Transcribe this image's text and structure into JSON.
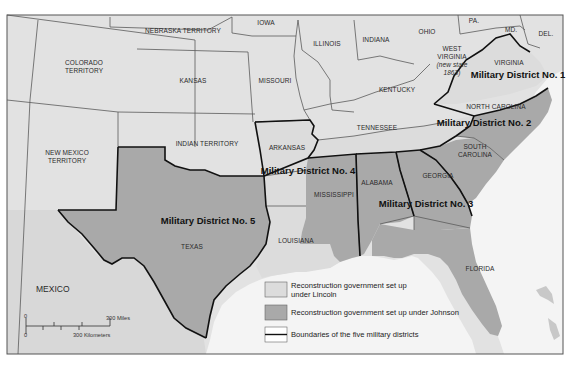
{
  "map": {
    "regions": {
      "nebraska": "NEBRASKA TERRITORY",
      "iowa": "IOWA",
      "illinois": "ILLINOIS",
      "indiana": "INDIANA",
      "ohio": "OHIO",
      "pennsylvania": "PA.",
      "maryland": "MD.",
      "delaware": "DEL.",
      "colorado_1": "COLORADO",
      "colorado_2": "TERRITORY",
      "kansas": "KANSAS",
      "missouri": "MISSOURI",
      "west_virginia_1": "WEST",
      "west_virginia_2": "VIRGINIA",
      "west_virginia_3": "(new state",
      "west_virginia_4": "1863)",
      "virginia": "VIRGINIA",
      "kentucky": "KENTUCKY",
      "north_carolina": "NORTH CAROLINA",
      "indian_territory": "INDIAN TERRITORY",
      "arkansas": "ARKANSAS",
      "tennessee": "TENNESSEE",
      "new_mexico_1": "NEW MEXICO",
      "new_mexico_2": "TERRITORY",
      "south_carolina_1": "SOUTH",
      "south_carolina_2": "CAROLINA",
      "mississippi": "MISSISSIPPI",
      "alabama": "ALABAMA",
      "georgia": "GEORGIA",
      "texas": "TEXAS",
      "louisiana": "LOUISIANA",
      "florida": "FLORIDA",
      "mexico": "MEXICO"
    },
    "districts": {
      "d1": "Military District No. 1",
      "d2": "Military District No. 2",
      "d3": "Military District No. 3",
      "d4": "Military District No. 4",
      "d5": "Military District No. 5"
    },
    "scale": {
      "miles_zero": "0",
      "miles_label": "300 Miles",
      "km_zero": "0",
      "km_label": "300 Kilometers"
    }
  },
  "legend": {
    "items": [
      {
        "label_line1": "Reconstruction government set up",
        "label_line2": "under Lincoln",
        "swatch": "#dcdcdc"
      },
      {
        "label_line1": "Reconstruction government set up under Johnson",
        "label_line2": "",
        "swatch": "#a9a9a9"
      },
      {
        "label_line1": "Boundaries of the five military districts",
        "label_line2": "",
        "swatch": "line"
      }
    ]
  },
  "colors": {
    "lincoln": "#dcdcdc",
    "johnson": "#a9a9a9",
    "water": "#f4f4f4",
    "border": "#111111"
  }
}
